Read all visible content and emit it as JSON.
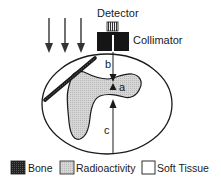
{
  "diagram": {
    "labels": {
      "detector": "Detector",
      "collimator": "Collimator",
      "distance_b": "b",
      "distance_a": "a",
      "distance_c": "c"
    },
    "legend": [
      {
        "key": "bone",
        "label": "Bone",
        "fill": "#1e1e1e"
      },
      {
        "key": "radioactivity",
        "label": "Radioactivity",
        "fill": "#cfcfcf"
      },
      {
        "key": "soft_tissue",
        "label": "Soft Tissue",
        "fill": "#ffffff"
      }
    ],
    "incoming_arrows": 3,
    "colors": {
      "stroke": "#1a1a1a",
      "radioactivity": "#cfcfcf",
      "bone": "#1e1e1e",
      "detector_crystal": "#6a6a6a"
    }
  }
}
